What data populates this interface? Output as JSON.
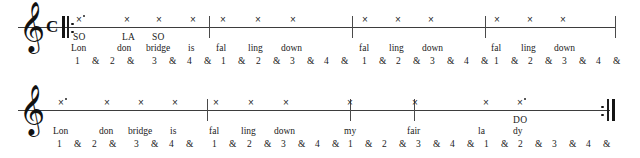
{
  "document": {
    "title": "London Bridge Is Falling Down — rhythm and solfege worksheet",
    "ink_color": "#1c1c1c",
    "paper_color": "#ffffff"
  },
  "glyphs": {
    "treble_clef": "𝄞",
    "common_time": "C",
    "notehead_x": "×",
    "augmentation_dot": "•",
    "ampersand": "&"
  },
  "systems": [
    {
      "id": "system-1",
      "staff_y": 27,
      "staff_start_x": 18,
      "staff_end_x": 616,
      "clef": "treble-clef",
      "time_signature": "C",
      "has_start_repeat": true,
      "has_end_repeat": false,
      "barlines_x": [
        209,
        352,
        485,
        615
      ],
      "notes": [
        {
          "x": 76,
          "dotted": true,
          "solfege": "SO",
          "lyric": "Lon",
          "beat": "1"
        },
        {
          "x": 124,
          "dotted": false,
          "solfege": "LA",
          "lyric": "don",
          "beat": "2&"
        },
        {
          "x": 156,
          "dotted": false,
          "solfege": "SO",
          "lyric": "bridge",
          "beat": "3"
        },
        {
          "x": 190,
          "dotted": false,
          "solfege": "",
          "lyric": "is",
          "beat": "4"
        },
        {
          "x": 220,
          "dotted": false,
          "solfege": "",
          "lyric": "fal",
          "beat": "1"
        },
        {
          "x": 255,
          "dotted": false,
          "solfege": "",
          "lyric": "ling",
          "beat": "2"
        },
        {
          "x": 290,
          "dotted": false,
          "solfege": "",
          "lyric": "down",
          "beat": "3"
        },
        {
          "x": 362,
          "dotted": false,
          "solfege": "",
          "lyric": "fal",
          "beat": "1"
        },
        {
          "x": 395,
          "dotted": false,
          "solfege": "",
          "lyric": "ling",
          "beat": "2"
        },
        {
          "x": 428,
          "dotted": false,
          "solfege": "",
          "lyric": "down",
          "beat": "3"
        },
        {
          "x": 494,
          "dotted": false,
          "solfege": "",
          "lyric": "fal",
          "beat": "1"
        },
        {
          "x": 527,
          "dotted": false,
          "solfege": "",
          "lyric": "ling",
          "beat": "2"
        },
        {
          "x": 560,
          "dotted": false,
          "solfege": "",
          "lyric": "down",
          "beat": "3"
        }
      ],
      "solfege_row": [
        {
          "x": 73,
          "text": "SO"
        },
        {
          "x": 122,
          "text": "LA"
        },
        {
          "x": 152,
          "text": "SO"
        }
      ],
      "lyric_row": [
        {
          "x": 71,
          "text": "Lon"
        },
        {
          "x": 117,
          "text": "don"
        },
        {
          "x": 146,
          "text": "bridge"
        },
        {
          "x": 188,
          "text": "is"
        },
        {
          "x": 216,
          "text": "fal"
        },
        {
          "x": 248,
          "text": "ling"
        },
        {
          "x": 281,
          "text": "down"
        },
        {
          "x": 359,
          "text": "fal"
        },
        {
          "x": 389,
          "text": "ling"
        },
        {
          "x": 422,
          "text": "down"
        },
        {
          "x": 491,
          "text": "fal"
        },
        {
          "x": 521,
          "text": "ling"
        },
        {
          "x": 554,
          "text": "down"
        }
      ],
      "count_row": [
        {
          "x": 75,
          "text": "1"
        },
        {
          "x": 92,
          "text": "&"
        },
        {
          "x": 110,
          "text": "2"
        },
        {
          "x": 127,
          "text": "&"
        },
        {
          "x": 152,
          "text": "3"
        },
        {
          "x": 169,
          "text": "&"
        },
        {
          "x": 187,
          "text": "4"
        },
        {
          "x": 204,
          "text": "&"
        },
        {
          "x": 221,
          "text": "1"
        },
        {
          "x": 238,
          "text": "&"
        },
        {
          "x": 256,
          "text": "2"
        },
        {
          "x": 273,
          "text": "&"
        },
        {
          "x": 290,
          "text": "3"
        },
        {
          "x": 307,
          "text": "&"
        },
        {
          "x": 324,
          "text": "4"
        },
        {
          "x": 341,
          "text": "&"
        },
        {
          "x": 362,
          "text": "1"
        },
        {
          "x": 379,
          "text": "&"
        },
        {
          "x": 396,
          "text": "2"
        },
        {
          "x": 413,
          "text": "&"
        },
        {
          "x": 430,
          "text": "3"
        },
        {
          "x": 447,
          "text": "&"
        },
        {
          "x": 464,
          "text": "4"
        },
        {
          "x": 481,
          "text": "&"
        },
        {
          "x": 494,
          "text": "1"
        },
        {
          "x": 511,
          "text": "&"
        },
        {
          "x": 528,
          "text": "2"
        },
        {
          "x": 545,
          "text": "&"
        },
        {
          "x": 562,
          "text": "3"
        },
        {
          "x": 579,
          "text": "&"
        },
        {
          "x": 596,
          "text": "4"
        },
        {
          "x": 613,
          "text": "&"
        }
      ]
    },
    {
      "id": "system-2",
      "staff_y": 110,
      "staff_start_x": 18,
      "staff_end_x": 610,
      "clef": "treble-clef",
      "time_signature": "",
      "has_start_repeat": false,
      "has_end_repeat": true,
      "barlines_x": [
        207,
        350,
        414
      ],
      "notes": [
        {
          "x": 58,
          "dotted": true,
          "solfege": "",
          "lyric": "Lon",
          "beat": "1"
        },
        {
          "x": 104,
          "dotted": false,
          "solfege": "",
          "lyric": "don",
          "beat": "2&"
        },
        {
          "x": 138,
          "dotted": false,
          "solfege": "",
          "lyric": "bridge",
          "beat": "3"
        },
        {
          "x": 172,
          "dotted": false,
          "solfege": "",
          "lyric": "is",
          "beat": "4"
        },
        {
          "x": 213,
          "dotted": false,
          "solfege": "",
          "lyric": "fal",
          "beat": "1"
        },
        {
          "x": 248,
          "dotted": false,
          "solfege": "",
          "lyric": "ling",
          "beat": "2"
        },
        {
          "x": 283,
          "dotted": false,
          "solfege": "",
          "lyric": "down",
          "beat": "3"
        },
        {
          "x": 347,
          "dotted": false,
          "solfege": "",
          "lyric": "my",
          "beat": "1"
        },
        {
          "x": 412,
          "dotted": false,
          "solfege": "",
          "lyric": "fair",
          "beat": "3"
        },
        {
          "x": 483,
          "dotted": false,
          "solfege": "",
          "lyric": "la",
          "beat": "1"
        },
        {
          "x": 517,
          "dotted": true,
          "solfege": "DO",
          "lyric": "dy",
          "beat": "2"
        }
      ],
      "solfege_row": [
        {
          "x": 513,
          "text": "DO"
        }
      ],
      "lyric_row": [
        {
          "x": 53,
          "text": "Lon"
        },
        {
          "x": 99,
          "text": "don"
        },
        {
          "x": 128,
          "text": "bridge"
        },
        {
          "x": 170,
          "text": "is"
        },
        {
          "x": 209,
          "text": "fal"
        },
        {
          "x": 241,
          "text": "ling"
        },
        {
          "x": 274,
          "text": "down"
        },
        {
          "x": 344,
          "text": "my"
        },
        {
          "x": 407,
          "text": "fair"
        },
        {
          "x": 478,
          "text": "la"
        },
        {
          "x": 513,
          "text": "dy"
        }
      ],
      "count_row": [
        {
          "x": 57,
          "text": "1"
        },
        {
          "x": 74,
          "text": "&"
        },
        {
          "x": 92,
          "text": "2"
        },
        {
          "x": 109,
          "text": "&"
        },
        {
          "x": 134,
          "text": "3"
        },
        {
          "x": 151,
          "text": "&"
        },
        {
          "x": 169,
          "text": "4"
        },
        {
          "x": 186,
          "text": "&"
        },
        {
          "x": 212,
          "text": "1"
        },
        {
          "x": 229,
          "text": "&"
        },
        {
          "x": 247,
          "text": "2"
        },
        {
          "x": 264,
          "text": "&"
        },
        {
          "x": 281,
          "text": "3"
        },
        {
          "x": 298,
          "text": "&"
        },
        {
          "x": 315,
          "text": "4"
        },
        {
          "x": 332,
          "text": "&"
        },
        {
          "x": 348,
          "text": "1"
        },
        {
          "x": 365,
          "text": "&"
        },
        {
          "x": 382,
          "text": "2"
        },
        {
          "x": 399,
          "text": "&"
        },
        {
          "x": 416,
          "text": "3"
        },
        {
          "x": 433,
          "text": "&"
        },
        {
          "x": 450,
          "text": "4"
        },
        {
          "x": 467,
          "text": "&"
        },
        {
          "x": 484,
          "text": "1"
        },
        {
          "x": 501,
          "text": "&"
        },
        {
          "x": 518,
          "text": "2"
        },
        {
          "x": 535,
          "text": "&"
        },
        {
          "x": 552,
          "text": "3"
        },
        {
          "x": 569,
          "text": "&"
        },
        {
          "x": 586,
          "text": "4"
        },
        {
          "x": 603,
          "text": "&"
        }
      ]
    }
  ]
}
